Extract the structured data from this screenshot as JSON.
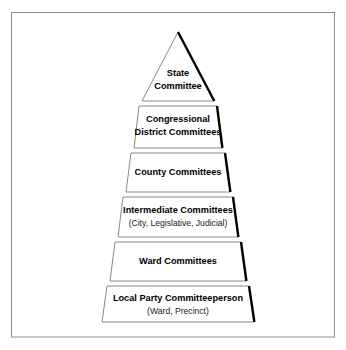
{
  "diagram": {
    "shape": "pyramid",
    "frame": {
      "stroke_color": "#8d8d8d"
    },
    "shadow_color": "#000000",
    "outline_color": "#8a8a8a",
    "background": "#ffffff",
    "tiers": [
      {
        "id": "state-committee",
        "level": 1,
        "label": "State",
        "label2": "Committee",
        "sublabel": "",
        "shape": "triangle"
      },
      {
        "id": "congressional-district-committees",
        "level": 2,
        "label": "Congressional",
        "label2": "District Committees",
        "sublabel": "",
        "shape": "trapezoid"
      },
      {
        "id": "county-committees",
        "level": 3,
        "label": "County Committees",
        "label2": "",
        "sublabel": "",
        "shape": "trapezoid"
      },
      {
        "id": "intermediate-committees",
        "level": 4,
        "label": "Intermediate Committees",
        "label2": "",
        "sublabel": "(City, Legislative, Judicial)",
        "shape": "trapezoid"
      },
      {
        "id": "ward-committees",
        "level": 5,
        "label": "Ward Committees",
        "label2": "",
        "sublabel": "",
        "shape": "trapezoid"
      },
      {
        "id": "local-party-committeeperson",
        "level": 6,
        "label": "Local Party Committeeperson",
        "label2": "",
        "sublabel": "(Ward, Precinct)",
        "shape": "trapezoid"
      }
    ]
  }
}
